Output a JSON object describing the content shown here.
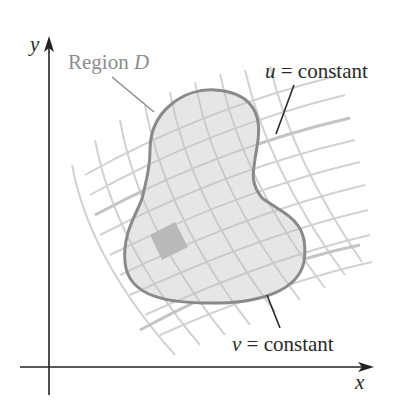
{
  "figure": {
    "axes": {
      "x_label": "x",
      "y_label": "y"
    },
    "labels": {
      "region_prefix": "Region ",
      "region_var": "D",
      "u_var": "u",
      "u_text": " = constant",
      "v_var": "v",
      "v_text": " = constant"
    },
    "colors": {
      "axis": "#222222",
      "grid": "#cfcfcf",
      "region_fill": "#e4e4e4",
      "region_stroke": "#8a8a8a",
      "highlight_cell": "#b8b8b8",
      "label_gray": "#8e8e8e",
      "label_dark": "#2a2a2a"
    }
  }
}
